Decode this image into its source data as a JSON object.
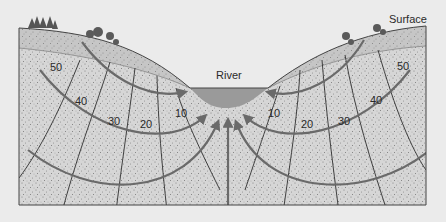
{
  "diagram": {
    "type": "groundwater-flow-cross-section",
    "labels": {
      "surface": "Surface",
      "river": "River"
    },
    "equipotential_values_left": [
      "50",
      "40",
      "30",
      "20",
      "10"
    ],
    "equipotential_values_right": [
      "10",
      "20",
      "30",
      "40",
      "50"
    ],
    "colors": {
      "background": "#ebebeb",
      "aquifer": "#d4d4d4",
      "unsaturated_zone": "#c4c4c4",
      "river_water": "#9a9a9a",
      "flow_line": "#6a6a6a",
      "equipotential_line": "#2f2f2f",
      "outline": "#444444",
      "trees": "#555555"
    }
  }
}
